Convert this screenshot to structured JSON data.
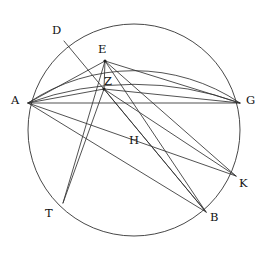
{
  "figure": {
    "kind": "euclidean-geometry-diagram",
    "background_color": "#ffffff",
    "stroke_color": "#333333",
    "label_color": "#111111",
    "width": 269,
    "height": 257
  },
  "labels": {
    "A": "A",
    "B": "B",
    "D": "D",
    "E": "E",
    "G": "G",
    "H": "H",
    "K": "K",
    "T": "T",
    "Z": "Z"
  },
  "label_positions": {
    "A": {
      "x": 11,
      "y": 95
    },
    "B": {
      "x": 210,
      "y": 212
    },
    "D": {
      "x": 52,
      "y": 25
    },
    "E": {
      "x": 98,
      "y": 44
    },
    "G": {
      "x": 246,
      "y": 95
    },
    "H": {
      "x": 129,
      "y": 135
    },
    "K": {
      "x": 239,
      "y": 178
    },
    "T": {
      "x": 45,
      "y": 208
    },
    "Z": {
      "x": 104,
      "y": 76
    }
  },
  "points": {
    "A": {
      "x": 28,
      "y": 103
    },
    "B": {
      "x": 206,
      "y": 212
    },
    "D": {
      "x": 64,
      "y": 41
    },
    "E": {
      "x": 105,
      "y": 61
    },
    "G": {
      "x": 240,
      "y": 103
    },
    "K": {
      "x": 236,
      "y": 176
    },
    "T": {
      "x": 63,
      "y": 203
    },
    "Z": {
      "x": 104,
      "y": 89
    }
  },
  "main_circle": {
    "cx": 134,
    "cy": 130,
    "r": 106
  },
  "upper_arc_AEG": {
    "from": "A",
    "to": "G",
    "through": "E",
    "radius": 190
  },
  "lower_arc_AZG": {
    "from": "A",
    "to": "G",
    "through": "Z",
    "radius": 310
  },
  "segments": [
    {
      "name": "A-G",
      "from": "A",
      "to": "G"
    },
    {
      "name": "A-E",
      "from": "A",
      "to": "E"
    },
    {
      "name": "A-Z",
      "from": "A",
      "to": "Z"
    },
    {
      "name": "A-K",
      "from": "A",
      "to": "K"
    },
    {
      "name": "A-B",
      "from": "A",
      "to": "B"
    },
    {
      "name": "E-Z",
      "from": "E",
      "to": "Z"
    },
    {
      "name": "E-G",
      "from": "E",
      "to": "G"
    },
    {
      "name": "E-K",
      "from": "E",
      "to": "K"
    },
    {
      "name": "E-B",
      "from": "E",
      "to": "B"
    },
    {
      "name": "E-T",
      "from": "E",
      "to": "T"
    },
    {
      "name": "Z-G",
      "from": "Z",
      "to": "G"
    },
    {
      "name": "Z-K",
      "from": "Z",
      "to": "K"
    },
    {
      "name": "Z-B",
      "from": "Z",
      "to": "B"
    },
    {
      "name": "Z-T",
      "from": "Z",
      "to": "T"
    },
    {
      "name": "D-B",
      "from": "D",
      "to": "B"
    }
  ]
}
